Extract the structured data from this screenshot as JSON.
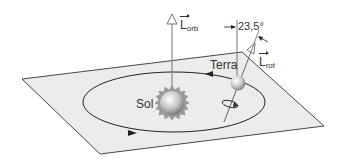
{
  "diagram": {
    "labels": {
      "sun": "Sol",
      "earth": "Terra",
      "tilt_angle": "23,5°",
      "orbital_angular_momentum": {
        "symbol": "L",
        "subscript": "orb"
      },
      "rotational_angular_momentum": {
        "symbol": "L",
        "subscript": "rot"
      }
    },
    "colors": {
      "plane_fill": "#ececec",
      "plane_stroke": "#333333",
      "orbit_stroke": "#222222",
      "axis_stroke": "#555555",
      "sun_highlight": "#ffffff",
      "sun_shadow": "#8a8a8a",
      "earth_highlight": "#ffffff",
      "earth_shadow": "#8e8e8e"
    }
  }
}
